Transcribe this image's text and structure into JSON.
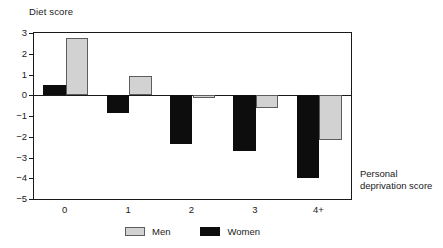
{
  "chart_data": {
    "type": "bar",
    "title": "",
    "ylabel": "Diet score",
    "xlabel": "Personal deprivation score",
    "xlabel_line1": "Personal",
    "xlabel_line2": "deprivation score",
    "categories": [
      "0",
      "1",
      "2",
      "3",
      "4+"
    ],
    "series": [
      {
        "name": "Men",
        "color": "#d2d2d2",
        "values": [
          2.75,
          0.95,
          -0.15,
          -0.6,
          -2.15
        ]
      },
      {
        "name": "Women",
        "color": "#0d0d0d",
        "values": [
          0.5,
          -0.85,
          -2.35,
          -2.7,
          -4.0
        ]
      }
    ],
    "series_draw_order": [
      "Women",
      "Men"
    ],
    "ylim": [
      -5,
      3
    ],
    "yticks": [
      3,
      2,
      1,
      0,
      -1,
      -2,
      -3,
      -4,
      -5
    ],
    "ytick_labels": [
      "3",
      "2",
      "1",
      "0",
      "−1",
      "−2",
      "−3",
      "−4",
      "−5"
    ],
    "grid": false,
    "legend_position": "bottom-center",
    "zero_line": 0
  },
  "legend": {
    "items": [
      {
        "label": "Men",
        "swatch": "men"
      },
      {
        "label": "Women",
        "swatch": "women"
      }
    ]
  }
}
